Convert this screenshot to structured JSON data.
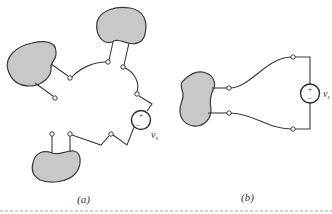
{
  "figure": {
    "panels": [
      {
        "id": "a",
        "label": "(a)",
        "blobs": 3,
        "source": {
          "plus": "+",
          "minus": "−",
          "label": "v",
          "subscript": "s"
        }
      },
      {
        "id": "b",
        "label": "(b)",
        "blobs": 1,
        "source": {
          "plus": "+",
          "minus": "−",
          "label": "v",
          "subscript": "s"
        }
      }
    ],
    "colors": {
      "blob_fill": "#c8c8c8",
      "stroke": "#3a3a3a",
      "background": "#ffffff"
    },
    "caption_visible": "truncated/illegible"
  }
}
